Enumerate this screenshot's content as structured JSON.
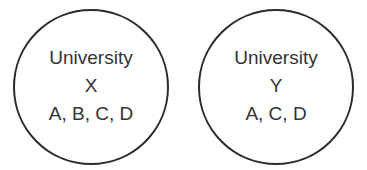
{
  "diagram": {
    "circles": [
      {
        "name": "University",
        "id_label": "X",
        "members": "A, B, C, D"
      },
      {
        "name": "University",
        "id_label": "Y",
        "members": "A, C, D"
      }
    ],
    "colors": {
      "stroke": "#2a2a2a",
      "text": "#333333",
      "background": "#ffffff"
    }
  }
}
